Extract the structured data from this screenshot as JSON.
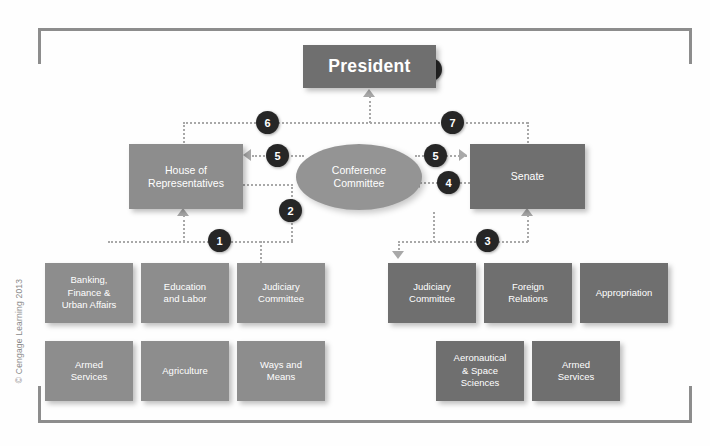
{
  "figure": {
    "copyright": "© Cengage Learning 2013",
    "colors": {
      "frame": "#8d8d8d",
      "president_box": "#6f6f6f",
      "house_box": "#8d8d8d",
      "senate_box": "#6f6f6f",
      "conference_ellipse": "#949494",
      "house_committee": "#8d8d8d",
      "senate_committee": "#6f6f6f",
      "connector": "#a8a8a8",
      "step_circle": "#262626",
      "node_text": "#ffffff"
    }
  },
  "nodes": {
    "president": "President",
    "house": "House of\nRepresentatives",
    "house_line1": "House of",
    "house_line2": "Representatives",
    "senate": "Senate",
    "conference_line1": "Conference",
    "conference_line2": "Committee"
  },
  "house_committees": [
    {
      "line1": "Banking,",
      "line2": "Finance &",
      "line3": "Urban Affairs"
    },
    {
      "line1": "Education",
      "line2": "and Labor",
      "line3": ""
    },
    {
      "line1": "Judiciary",
      "line2": "Committee",
      "line3": ""
    },
    {
      "line1": "Armed",
      "line2": "Services",
      "line3": ""
    },
    {
      "line1": "Agriculture",
      "line2": "",
      "line3": ""
    },
    {
      "line1": "Ways and",
      "line2": "Means",
      "line3": ""
    }
  ],
  "senate_committees": [
    {
      "line1": "Judiciary",
      "line2": "Committee",
      "line3": ""
    },
    {
      "line1": "Foreign",
      "line2": "Relations",
      "line3": ""
    },
    {
      "line1": "Appropriation",
      "line2": "",
      "line3": ""
    },
    {
      "line1": "Aeronautical",
      "line2": "& Space",
      "line3": "Sciences"
    },
    {
      "line1": "Armed",
      "line2": "Services",
      "line3": ""
    }
  ],
  "steps": [
    {
      "number": "1",
      "meaning": "bill referred from House to House committees"
    },
    {
      "number": "2",
      "meaning": "House committee reports bill back to House floor"
    },
    {
      "number": "3",
      "meaning": "bill referred from Senate to Senate committees"
    },
    {
      "number": "4",
      "meaning": "Senate sends bill to conference committee"
    },
    {
      "number": "5",
      "meaning": "conference committee returns compromise bill to both chambers"
    },
    {
      "number": "6",
      "meaning": "House passes bill to President"
    },
    {
      "number": "7",
      "meaning": "Senate passes bill to President"
    },
    {
      "number": "8",
      "meaning": "President signs or vetoes the bill"
    }
  ]
}
